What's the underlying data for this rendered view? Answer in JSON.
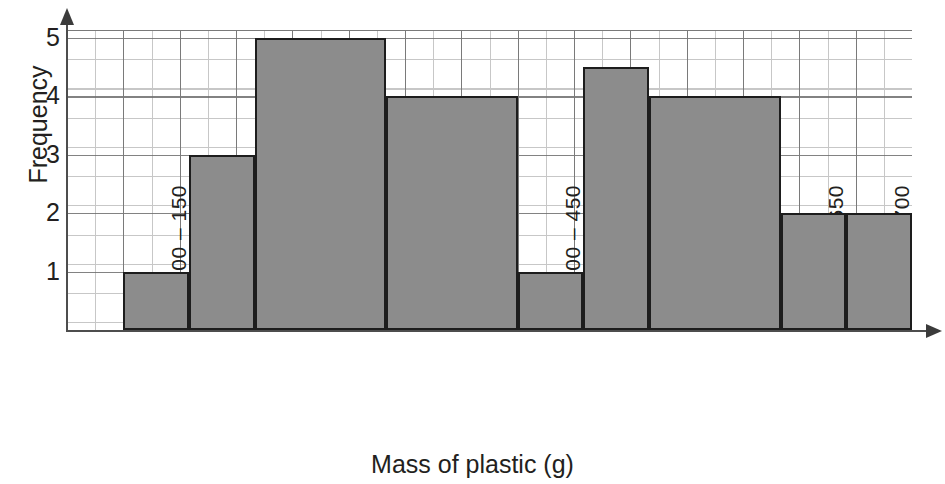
{
  "chart_data": {
    "type": "bar",
    "title": "",
    "xlabel": "Mass of plastic (g)",
    "ylabel": "Frequency",
    "categories": [
      "100 – 150",
      "150 – 200",
      "200 – 300",
      "300 – 400",
      "400 – 450",
      "450 – 500",
      "500 – 600",
      "600 – 650",
      "650 – 700"
    ],
    "values": [
      1,
      3,
      5,
      4,
      1,
      4.5,
      4,
      2,
      2
    ],
    "bin_edges": [
      100,
      150,
      200,
      300,
      400,
      450,
      500,
      600,
      650,
      700
    ],
    "ylim": [
      0,
      5.5
    ],
    "xlim": [
      50,
      750
    ],
    "y_ticks": [
      "1",
      "2",
      "3",
      "4",
      "5"
    ],
    "y_tick_values": [
      1,
      2,
      3,
      4,
      5
    ],
    "grid": true,
    "legend": "none",
    "bar_color": "#8c8c8c",
    "bar_edge_color": "#1d1d1d",
    "grid_color": "#9a9a9a",
    "axis_color": "#4d4d4d",
    "text_color": "#231f20"
  }
}
